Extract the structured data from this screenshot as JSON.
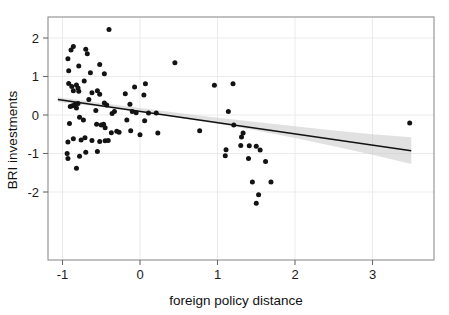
{
  "chart_data": {
    "type": "scatter",
    "title": "",
    "xlabel": "foreign policy distance",
    "ylabel": "BRI investments",
    "xlim": [
      -1.1,
      3.65
    ],
    "ylim": [
      -2.65,
      2.45
    ],
    "xticks": [
      -1,
      0,
      1,
      2,
      3
    ],
    "xticklabels": [
      "-1",
      "0",
      "1",
      "2",
      "3"
    ],
    "yticks": [
      -2,
      -1,
      0,
      1,
      2
    ],
    "yticklabels": [
      "-2",
      "-1",
      "0",
      "1",
      "2"
    ],
    "grid": true,
    "legend": "none",
    "points": [
      [
        -0.4,
        2.22
      ],
      [
        -0.86,
        1.78
      ],
      [
        -0.89,
        1.69
      ],
      [
        -0.7,
        1.71
      ],
      [
        -0.68,
        1.59
      ],
      [
        -0.93,
        1.46
      ],
      [
        -0.92,
        1.15
      ],
      [
        -0.79,
        1.27
      ],
      [
        -0.64,
        1.1
      ],
      [
        -0.52,
        1.31
      ],
      [
        -0.46,
        1.07
      ],
      [
        0.45,
        1.36
      ],
      [
        -0.92,
        0.82
      ],
      [
        -0.88,
        0.74
      ],
      [
        -0.86,
        0.63
      ],
      [
        -0.82,
        0.78
      ],
      [
        -0.8,
        0.7
      ],
      [
        -0.79,
        0.62
      ],
      [
        -0.72,
        0.88
      ],
      [
        -0.62,
        0.58
      ],
      [
        -0.55,
        0.63
      ],
      [
        -0.52,
        0.54
      ],
      [
        -0.19,
        0.55
      ],
      [
        -0.07,
        0.73
      ],
      [
        0.07,
        0.81
      ],
      [
        0.05,
        0.52
      ],
      [
        0.96,
        0.77
      ],
      [
        1.2,
        0.81
      ],
      [
        -0.9,
        0.22
      ],
      [
        -0.87,
        0.24
      ],
      [
        -0.84,
        0.27
      ],
      [
        -0.82,
        0.18
      ],
      [
        -0.8,
        0.3
      ],
      [
        -0.66,
        0.4
      ],
      [
        -0.57,
        0.12
      ],
      [
        -0.46,
        0.31
      ],
      [
        -0.43,
        0.26
      ],
      [
        -0.36,
        0.04
      ],
      [
        -0.33,
        0.09
      ],
      [
        -0.13,
        0.28
      ],
      [
        -0.1,
        0.09
      ],
      [
        -0.05,
        0.06
      ],
      [
        0.11,
        0.05
      ],
      [
        0.21,
        0.05
      ],
      [
        1.14,
        0.09
      ],
      [
        -0.91,
        -0.22
      ],
      [
        -0.78,
        -0.06
      ],
      [
        -0.73,
        -0.13
      ],
      [
        -0.56,
        -0.24
      ],
      [
        -0.5,
        -0.26
      ],
      [
        -0.47,
        -0.24
      ],
      [
        -0.45,
        -0.33
      ],
      [
        -0.37,
        -0.46
      ],
      [
        -0.3,
        -0.42
      ],
      [
        -0.27,
        -0.45
      ],
      [
        -0.17,
        -0.13
      ],
      [
        -0.12,
        -0.41
      ],
      [
        0.0,
        -0.51
      ],
      [
        0.06,
        -0.15
      ],
      [
        0.23,
        -0.47
      ],
      [
        0.77,
        -0.41
      ],
      [
        1.21,
        -0.26
      ],
      [
        1.31,
        -0.57
      ],
      [
        1.33,
        -0.47
      ],
      [
        -0.93,
        -0.7
      ],
      [
        -0.86,
        -0.62
      ],
      [
        -0.76,
        -0.65
      ],
      [
        -0.71,
        -0.59
      ],
      [
        -0.62,
        -0.66
      ],
      [
        -0.52,
        -0.69
      ],
      [
        -0.45,
        -0.67
      ],
      [
        -0.41,
        -0.66
      ],
      [
        1.3,
        -0.79
      ],
      [
        1.41,
        -0.8
      ],
      [
        1.5,
        -0.81
      ],
      [
        -0.94,
        -1.0
      ],
      [
        -0.93,
        -1.13
      ],
      [
        -0.78,
        -1.07
      ],
      [
        -0.7,
        -0.97
      ],
      [
        -0.55,
        -0.95
      ],
      [
        1.11,
        -0.9
      ],
      [
        1.55,
        -0.91
      ],
      [
        1.1,
        -1.06
      ],
      [
        -0.82,
        -1.38
      ],
      [
        1.4,
        -1.13
      ],
      [
        1.62,
        -1.21
      ],
      [
        1.45,
        -1.74
      ],
      [
        1.69,
        -1.74
      ],
      [
        1.53,
        -2.07
      ],
      [
        1.5,
        -2.29
      ],
      [
        3.48,
        -0.21
      ]
    ],
    "fit_line": {
      "label": "linear fit",
      "x": [
        -1.06,
        3.5
      ],
      "y": [
        0.4,
        -0.93
      ],
      "slope": -0.292,
      "intercept": 0.091
    },
    "confidence_band": {
      "label": "confidence interval",
      "x": [
        -1.06,
        -0.5,
        0.0,
        0.5,
        1.0,
        1.5,
        2.0,
        2.5,
        3.0,
        3.5
      ],
      "upper": [
        0.46,
        0.31,
        0.18,
        0.05,
        -0.07,
        -0.18,
        -0.29,
        -0.4,
        -0.5,
        -0.58
      ],
      "lower": [
        0.34,
        0.21,
        0.08,
        -0.07,
        -0.23,
        -0.4,
        -0.6,
        -0.81,
        -1.03,
        -1.27
      ]
    }
  },
  "axes": {
    "x_title": "foreign policy distance",
    "y_title": "BRI investments"
  }
}
